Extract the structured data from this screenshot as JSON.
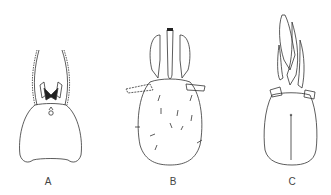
{
  "figure": {
    "panels": [
      {
        "label": "A",
        "description": "head, frontal view with antennae and mouthparts"
      },
      {
        "label": "B",
        "description": "head, dorsal view with elongated rostrum"
      },
      {
        "label": "C",
        "description": "head, ventral view with mandibles"
      }
    ]
  }
}
